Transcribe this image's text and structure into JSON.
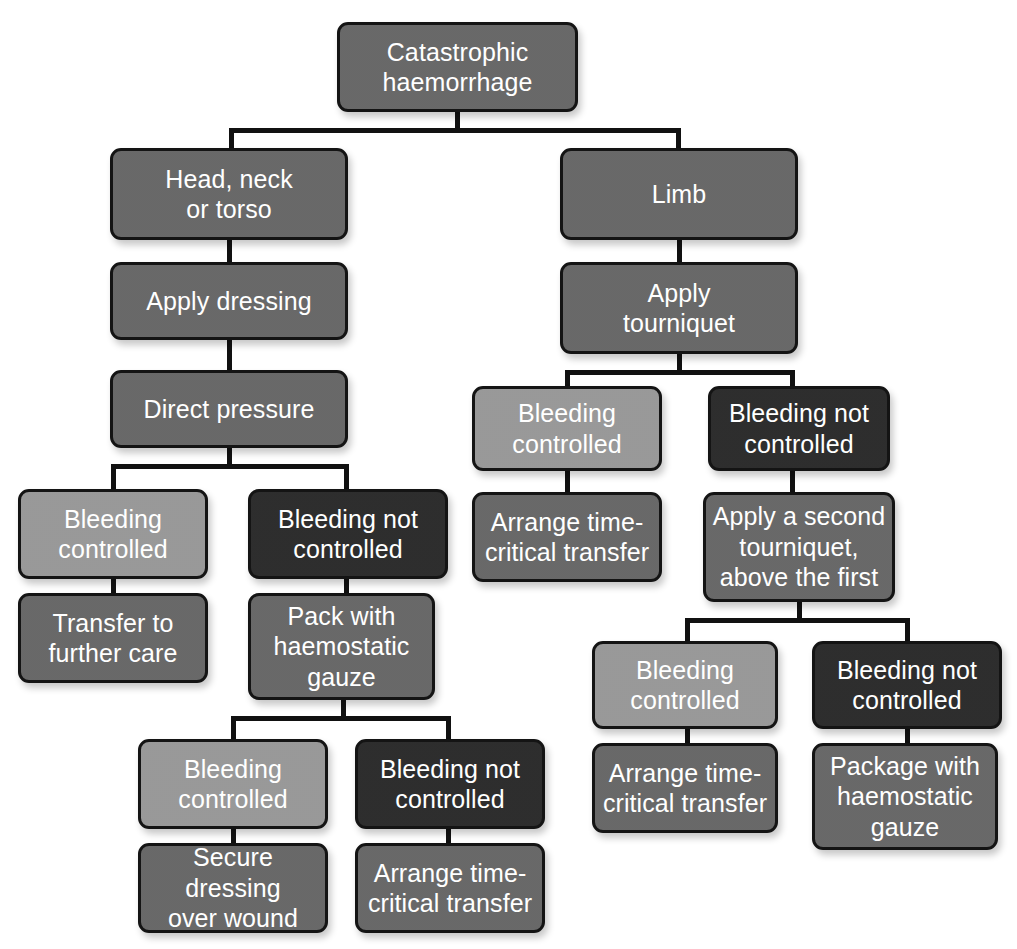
{
  "diagram": {
    "palette": {
      "mid_gray": "#636363",
      "light_gray": "#959595",
      "dark": "#262626",
      "line": "#141414",
      "text": "#ffffff",
      "background": "#ffffff"
    },
    "nodes": [
      {
        "id": "root",
        "label": "Catastrophic\nhaemorrhage",
        "tone": "mid",
        "x": 337,
        "y": 22,
        "w": 241,
        "h": 90
      },
      {
        "id": "hnt",
        "label": "Head, neck\nor torso",
        "tone": "mid",
        "x": 110,
        "y": 148,
        "w": 238,
        "h": 92
      },
      {
        "id": "dressing",
        "label": "Apply dressing",
        "tone": "mid",
        "x": 110,
        "y": 262,
        "w": 238,
        "h": 78
      },
      {
        "id": "pressure",
        "label": "Direct pressure",
        "tone": "mid",
        "x": 110,
        "y": 370,
        "w": 238,
        "h": 78
      },
      {
        "id": "l-ctrl",
        "label": "Bleeding\ncontrolled",
        "tone": "light",
        "x": 18,
        "y": 489,
        "w": 190,
        "h": 90
      },
      {
        "id": "l-transfer",
        "label": "Transfer to\nfurther care",
        "tone": "mid",
        "x": 18,
        "y": 593,
        "w": 190,
        "h": 90
      },
      {
        "id": "l-notctrl",
        "label": "Bleeding not\ncontrolled",
        "tone": "dark",
        "x": 248,
        "y": 489,
        "w": 200,
        "h": 90
      },
      {
        "id": "l-pack",
        "label": "Pack with\nhaemostatic\ngauze",
        "tone": "mid",
        "x": 248,
        "y": 593,
        "w": 187,
        "h": 107
      },
      {
        "id": "l2-ctrl",
        "label": "Bleeding\ncontrolled",
        "tone": "light",
        "x": 138,
        "y": 739,
        "w": 190,
        "h": 90
      },
      {
        "id": "l2-secure",
        "label": "Secure dressing\nover wound",
        "tone": "mid",
        "x": 138,
        "y": 843,
        "w": 190,
        "h": 90
      },
      {
        "id": "l2-notctrl",
        "label": "Bleeding not\ncontrolled",
        "tone": "dark",
        "x": 355,
        "y": 739,
        "w": 190,
        "h": 90
      },
      {
        "id": "l2-arrange",
        "label": "Arrange time-\ncritical transfer",
        "tone": "mid",
        "x": 355,
        "y": 843,
        "w": 190,
        "h": 90
      },
      {
        "id": "limb",
        "label": "Limb",
        "tone": "mid",
        "x": 560,
        "y": 148,
        "w": 238,
        "h": 92
      },
      {
        "id": "tourniquet",
        "label": "Apply\ntourniquet",
        "tone": "mid",
        "x": 560,
        "y": 262,
        "w": 238,
        "h": 92
      },
      {
        "id": "r-ctrl",
        "label": "Bleeding\ncontrolled",
        "tone": "light",
        "x": 472,
        "y": 386,
        "w": 190,
        "h": 85
      },
      {
        "id": "r-arrange",
        "label": "Arrange time-\ncritical transfer",
        "tone": "mid",
        "x": 472,
        "y": 492,
        "w": 190,
        "h": 90
      },
      {
        "id": "r-notctrl",
        "label": "Bleeding not\ncontrolled",
        "tone": "dark",
        "x": 708,
        "y": 386,
        "w": 182,
        "h": 85
      },
      {
        "id": "r-second",
        "label": "Apply a second\ntourniquet,\nabove the first",
        "tone": "mid",
        "x": 703,
        "y": 492,
        "w": 192,
        "h": 110
      },
      {
        "id": "r2-ctrl",
        "label": "Bleeding\ncontrolled",
        "tone": "light",
        "x": 592,
        "y": 641,
        "w": 186,
        "h": 88
      },
      {
        "id": "r2-arrange",
        "label": "Arrange time-\ncritical transfer",
        "tone": "mid",
        "x": 592,
        "y": 743,
        "w": 186,
        "h": 90
      },
      {
        "id": "r2-notctrl",
        "label": "Bleeding not\ncontrolled",
        "tone": "dark",
        "x": 812,
        "y": 641,
        "w": 190,
        "h": 88
      },
      {
        "id": "r2-package",
        "label": "Package with\nhaemostatic\ngauze",
        "tone": "mid",
        "x": 812,
        "y": 743,
        "w": 186,
        "h": 107
      }
    ],
    "connectors": [
      {
        "id": "root-down",
        "o": "v",
        "x": 455,
        "y": 112,
        "len": 20
      },
      {
        "id": "root-split",
        "o": "h",
        "x": 229,
        "y": 128,
        "len": 452
      },
      {
        "id": "to-hnt",
        "o": "v",
        "x": 229,
        "y": 128,
        "len": 22
      },
      {
        "id": "to-limb",
        "o": "v",
        "x": 676,
        "y": 128,
        "len": 22
      },
      {
        "id": "hnt-dressing",
        "o": "v",
        "x": 227,
        "y": 238,
        "len": 26
      },
      {
        "id": "dressing-pressure",
        "o": "v",
        "x": 227,
        "y": 338,
        "len": 34
      },
      {
        "id": "pressure-down",
        "o": "v",
        "x": 227,
        "y": 446,
        "len": 22
      },
      {
        "id": "l-split",
        "o": "h",
        "x": 111,
        "y": 464,
        "len": 238
      },
      {
        "id": "l-split-left",
        "o": "v",
        "x": 111,
        "y": 464,
        "len": 27
      },
      {
        "id": "l-split-right",
        "o": "v",
        "x": 344,
        "y": 464,
        "len": 27
      },
      {
        "id": "lctrl-transfer",
        "o": "v",
        "x": 111,
        "y": 577,
        "len": 18
      },
      {
        "id": "lnot-pack",
        "o": "v",
        "x": 344,
        "y": 577,
        "len": 18
      },
      {
        "id": "pack-down",
        "o": "v",
        "x": 341,
        "y": 698,
        "len": 20
      },
      {
        "id": "l2-split",
        "o": "h",
        "x": 231,
        "y": 716,
        "len": 220
      },
      {
        "id": "l2-split-left",
        "o": "v",
        "x": 231,
        "y": 716,
        "len": 25
      },
      {
        "id": "l2-split-right",
        "o": "v",
        "x": 446,
        "y": 716,
        "len": 25
      },
      {
        "id": "l2ctrl-secure",
        "o": "v",
        "x": 231,
        "y": 827,
        "len": 18
      },
      {
        "id": "l2not-arrange",
        "o": "v",
        "x": 446,
        "y": 827,
        "len": 18
      },
      {
        "id": "limb-tourniquet",
        "o": "v",
        "x": 677,
        "y": 238,
        "len": 26
      },
      {
        "id": "tourniquet-down",
        "o": "v",
        "x": 677,
        "y": 352,
        "len": 20
      },
      {
        "id": "r-split",
        "o": "h",
        "x": 565,
        "y": 370,
        "len": 230
      },
      {
        "id": "r-split-left",
        "o": "v",
        "x": 565,
        "y": 370,
        "len": 18
      },
      {
        "id": "r-split-right",
        "o": "v",
        "x": 790,
        "y": 370,
        "len": 18
      },
      {
        "id": "rctrl-arrange",
        "o": "v",
        "x": 565,
        "y": 469,
        "len": 25
      },
      {
        "id": "rnot-second",
        "o": "v",
        "x": 790,
        "y": 469,
        "len": 25
      },
      {
        "id": "second-down",
        "o": "v",
        "x": 797,
        "y": 600,
        "len": 22
      },
      {
        "id": "r2-split",
        "o": "h",
        "x": 685,
        "y": 618,
        "len": 225
      },
      {
        "id": "r2-split-left",
        "o": "v",
        "x": 685,
        "y": 618,
        "len": 25
      },
      {
        "id": "r2-split-right",
        "o": "v",
        "x": 905,
        "y": 618,
        "len": 25
      },
      {
        "id": "r2ctrl-arrange",
        "o": "v",
        "x": 685,
        "y": 727,
        "len": 18
      },
      {
        "id": "r2not-package",
        "o": "v",
        "x": 905,
        "y": 727,
        "len": 18
      }
    ]
  }
}
